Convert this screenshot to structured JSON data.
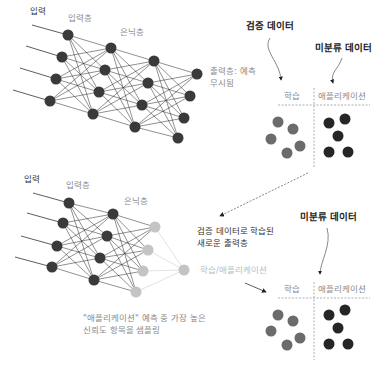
{
  "top_network": {
    "input_label": "입력",
    "input_layer_label": "입력층",
    "hidden_layer_label": "은닉층",
    "output_note_line1": "출력층: 예측",
    "output_note_line2": "무시됨"
  },
  "top_scatter": {
    "validation_data_label": "검증 데이터",
    "unlabeled_data_label": "미분류 데이터",
    "train_label": "학습",
    "application_label": "애플리케이션"
  },
  "bottom_network": {
    "input_label": "입력",
    "input_layer_label": "입력층",
    "hidden_layer_label": "은닉층",
    "new_output_note_line1": "검증 데이터로 학습된",
    "new_output_note_line2": "새로운 출력층",
    "train_app_label": "학습/애플리케이션",
    "sampling_note_line1": "\"애플리케이션\" 예측 중 가장 높은",
    "sampling_note_line2": "신뢰도 항목을 샘플링"
  },
  "bottom_scatter": {
    "unlabeled_data_label": "미분류 데이터",
    "train_label": "학습",
    "application_label": "애플리케이션"
  },
  "colors": {
    "node_dark": "#3a3a3a",
    "node_light": "#c4c4c4",
    "dot_gray": "#6b6b6b",
    "dot_dark": "#262626",
    "edge": "#222222",
    "edge_light": "#cfcfcf"
  }
}
